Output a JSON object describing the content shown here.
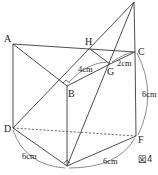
{
  "figure": {
    "caption": "図4",
    "points": {
      "A": {
        "label": "A",
        "x": 13,
        "y": 44
      },
      "B": {
        "label": "B",
        "x": 67,
        "y": 86
      },
      "C": {
        "label": "C",
        "x": 135,
        "y": 52
      },
      "D": {
        "label": "D",
        "x": 13,
        "y": 128
      },
      "E": {
        "label": "",
        "x": 67,
        "y": 166
      },
      "F": {
        "label": "F",
        "x": 136,
        "y": 136
      },
      "G": {
        "label": "G",
        "x": 110,
        "y": 64
      },
      "H": {
        "label": "H",
        "x": 90,
        "y": 49
      },
      "P": {
        "label": "",
        "x": 134,
        "y": 2
      }
    },
    "measurements": {
      "BG": "4cm",
      "GC": "2cm",
      "CF": "6cm",
      "DE": "6cm",
      "EF": "6cm"
    },
    "colors": {
      "line": "#3a3a3a",
      "text": "#222222",
      "background": "#ffffff"
    }
  }
}
